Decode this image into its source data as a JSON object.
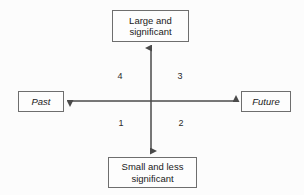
{
  "diagram": {
    "background_color": "#fcfcfc",
    "line_color": "#4a4a4a",
    "border_color": "#6e6e6e",
    "text_color": "#1a1a1a",
    "nodes": {
      "top": {
        "label": "Large and significant"
      },
      "bottom": {
        "label": "Small and less significant"
      },
      "left": {
        "label": "Past"
      },
      "right": {
        "label": "Future"
      }
    },
    "quadrants": [
      {
        "id": "quadrant-4",
        "label": "4",
        "position": "top-left"
      },
      {
        "id": "quadrant-3",
        "label": "3",
        "position": "top-right"
      },
      {
        "id": "quadrant-1",
        "label": "1",
        "position": "bottom-left"
      },
      {
        "id": "quadrant-2",
        "label": "2",
        "position": "bottom-right"
      }
    ],
    "axes": {
      "vertical": {
        "name": "significance-axis",
        "arrow_up": true,
        "arrow_down": true
      },
      "horizontal": {
        "name": "time-axis",
        "arrow_left": true,
        "arrow_right": true
      }
    }
  }
}
